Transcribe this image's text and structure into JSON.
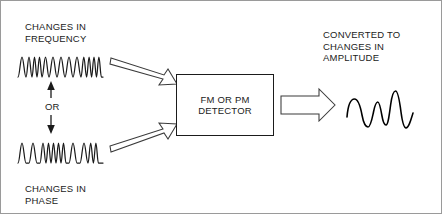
{
  "diagram": {
    "background_color": "#ffffff",
    "stroke_color": "#1b1b1b",
    "border_color": "#9a9a9a",
    "labels": {
      "input_top": "CHANGES IN\nFREQUENCY",
      "input_bottom": "CHANGES IN\nPHASE",
      "or_connector": "OR",
      "output": "CONVERTED TO\nCHANGES IN\nAMPLITUDE"
    },
    "block": {
      "label": "FM OR PM\nDETECTOR",
      "x": 175,
      "y": 73,
      "width": 98,
      "height": 62
    },
    "waveforms": [
      {
        "name": "frequency-modulated-wave",
        "description": "sine wave with varying frequency (FM)",
        "x": 16,
        "y": 52,
        "width": 86,
        "height": 26
      },
      {
        "name": "phase-modulated-wave",
        "description": "sine wave with abrupt phase changes (PM)",
        "x": 16,
        "y": 138,
        "width": 86,
        "height": 26
      },
      {
        "name": "amplitude-modulated-wave",
        "description": "sine wave with varying amplitude (AM output)",
        "x": 344,
        "y": 86,
        "width": 70,
        "height": 44
      }
    ],
    "arrows": [
      {
        "name": "arrow-fm-to-detector",
        "style": "hollow-outline",
        "direction": "down-right"
      },
      {
        "name": "arrow-pm-to-detector",
        "style": "hollow-outline",
        "direction": "up-right"
      },
      {
        "name": "arrow-detector-to-output",
        "style": "hollow-outline",
        "direction": "right"
      },
      {
        "name": "arrow-or-connector",
        "style": "solid-double-headed",
        "direction": "vertical"
      }
    ]
  }
}
